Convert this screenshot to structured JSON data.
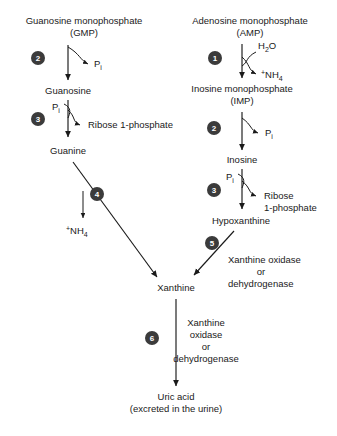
{
  "diagram": {
    "background_color": "#ffffff",
    "text_color": "#1a1a1a",
    "step_circle_color": "#3b3b3b",
    "step_number_color": "#ffffff"
  },
  "metabolites": {
    "gmp_line1": "Guanosine monophosphate",
    "gmp_line2": "(GMP)",
    "amp_line1": "Adenosine monophosphate",
    "amp_line2": "(AMP)",
    "guanosine": "Guanosine",
    "imp_line1": "Inosine monophosphate",
    "imp_line2": "(IMP)",
    "guanine": "Guanine",
    "inosine": "Inosine",
    "hypoxanthine": "Hypoxanthine",
    "xanthine": "Xanthine",
    "uric_acid_line1": "Uric acid",
    "uric_acid_line2": "(excreted in the urine)"
  },
  "cofactors": {
    "phosphate_gmp": "P",
    "phosphate_gmp_sub": "i",
    "phosphate_guanosine": "P",
    "phosphate_guanosine_sub": "i",
    "phosphate_imp": "P",
    "phosphate_imp_sub": "i",
    "phosphate_inosine": "P",
    "phosphate_inosine_sub": "i",
    "water": "H",
    "water_sub": "2",
    "water_end": "O",
    "ammonium_amp_sup": "+",
    "ammonium_amp": "NH",
    "ammonium_amp_sub": "4",
    "ammonium_guanine_sup": "+",
    "ammonium_guanine": "NH",
    "ammonium_guanine_sub": "4",
    "ribose1p_left": "Ribose 1-phosphate",
    "ribose1p_right_line1": "Ribose",
    "ribose1p_right_line2": "1-phosphate"
  },
  "enzymes": {
    "step5_line1": "Xanthine oxidase",
    "step5_line2": "or",
    "step5_line3": "dehydrogenase",
    "step6_line1": "Xanthine",
    "step6_line2": "oxidase",
    "step6_line3": "or",
    "step6_line4": "dehydrogenase"
  },
  "steps": [
    {
      "id": 1,
      "label": "1",
      "reaction": "AMP to IMP (deamination)"
    },
    {
      "id": 2,
      "label": "2",
      "reaction": "GMP to Guanosine / IMP to Inosine (phosphatase)"
    },
    {
      "id": 3,
      "label": "3",
      "reaction": "Guanosine to Guanine / Inosine to Hypoxanthine (phosphorylase)"
    },
    {
      "id": 4,
      "label": "4",
      "reaction": "Guanine to Xanthine (deamination)"
    },
    {
      "id": 5,
      "label": "5",
      "reaction": "Hypoxanthine to Xanthine"
    },
    {
      "id": 6,
      "label": "6",
      "reaction": "Xanthine to Uric acid"
    }
  ],
  "step_labels": {
    "s1": "1",
    "s2a": "2",
    "s2b": "2",
    "s3a": "3",
    "s3b": "3",
    "s4": "4",
    "s5": "5",
    "s6": "6"
  }
}
